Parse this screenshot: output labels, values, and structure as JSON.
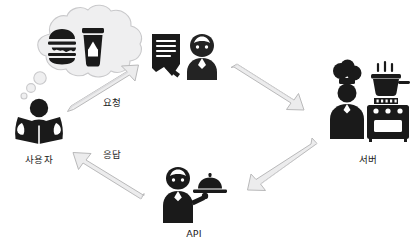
{
  "diagram": {
    "title_visible": false,
    "type": "restaurant-api-analogy-cycle",
    "background_color": "#ffffff",
    "ink_color": "#1a1a1a",
    "arrow_fill": "#ececed",
    "arrow_stroke": "#b9b9ba",
    "bubble_fill": "#efeff0"
  },
  "nodes": [
    {
      "id": "user",
      "label": "사용자",
      "icon": "person-reading-book-icon",
      "thought": {
        "icon": "thought-bubble-icon",
        "contents": [
          "burger-icon",
          "drink-cup-icon"
        ]
      }
    },
    {
      "id": "order-taker",
      "label": "",
      "icons": [
        "order-notepad-icon",
        "waitress-icon"
      ]
    },
    {
      "id": "server",
      "label": "서버",
      "icons": [
        "chef-icon",
        "stove-with-pot-icon"
      ]
    },
    {
      "id": "api",
      "label": "API",
      "icons": [
        "waitress-serving-tray-icon"
      ]
    }
  ],
  "arrows": [
    {
      "id": "request",
      "label": "요청",
      "from": "user",
      "to": "order-taker",
      "direction": "up-right"
    },
    {
      "id": "to-server",
      "label": "",
      "from": "order-taker",
      "to": "server",
      "direction": "down-right"
    },
    {
      "id": "to-api",
      "label": "",
      "from": "server",
      "to": "api",
      "direction": "down-left"
    },
    {
      "id": "response",
      "label": "응답",
      "from": "api",
      "to": "user",
      "direction": "up-left"
    }
  ]
}
